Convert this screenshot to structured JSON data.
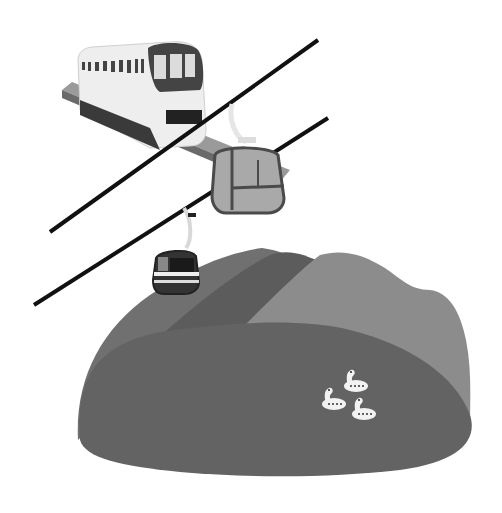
{
  "scene": {
    "description": "Grayscale illustration: monorail train on elevated track, two aerial cable cars on cables above green hills with a lake and three swan boats",
    "elements": [
      "monorail-train",
      "cable-line-upper",
      "cable-line-lower",
      "gondola-large",
      "gondola-small",
      "hills",
      "lake",
      "swan-boats"
    ],
    "swan_boat_count": 3,
    "gondola_count": 2
  },
  "colors": {
    "background": "#ffffff",
    "hill_back_left": "#6e6e6e",
    "hill_back_mid": "#5a5a5a",
    "hill_back_right": "#8a8a8a",
    "lake": "#626262",
    "cable": "#111111",
    "train_body": "#eeeeee",
    "train_dark": "#3a3a3a",
    "gondola_frame": "#4a4a4a",
    "gondola_body": "#a9a9a9",
    "swan": "#f2f2f2"
  }
}
